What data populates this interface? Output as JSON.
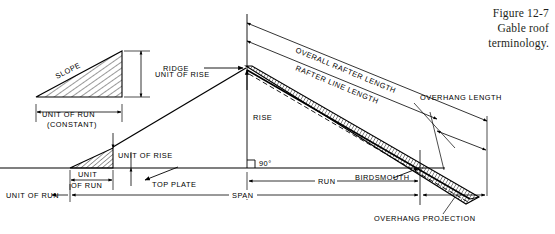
{
  "figure": {
    "caption_line1": "Figure 12-7",
    "caption_line2": "Gable roof",
    "caption_line3": "terminology."
  },
  "labels": {
    "slope": "SLOPE",
    "unit_of_rise_1": "UNIT OF RISE",
    "unit_of_run_constant_1": "UNIT OF RUN",
    "unit_of_run_constant_2": "(CONSTANT)",
    "unit_of_rise_2": "UNIT OF RISE",
    "unit_small_1": "UNIT",
    "unit_small_2": "OF RUN",
    "unit_of_run_left": "UNIT OF RUN",
    "top_plate": "TOP PLATE",
    "ridge": "RIDGE",
    "rise": "RISE",
    "angle_90": "90°",
    "overall_rafter_length": "OVERALL RAFTER LENGTH",
    "rafter_line_length": "RAFTER LINE LENGTH",
    "overhang_length": "OVERHANG LENGTH",
    "birdsmouth": "BIRDSMOUTH",
    "run": "RUN",
    "span": "SPAN",
    "overhang_projection": "OVERHANG PROJECTION"
  },
  "style": {
    "ink": "#000000",
    "caption_ink": "#231f20",
    "paper": "#ffffff",
    "label_font_size": "7.4",
    "caption_font_size": "11.5"
  },
  "geometry": {
    "ridge_point": [
      247,
      68
    ],
    "eave_point": [
      420,
      168
    ],
    "rafter_tail": [
      470,
      197
    ],
    "plate_line_y": 168,
    "span_left_x": 70,
    "run_left_x": 247
  },
  "diagram": {
    "type": "technical-line-drawing"
  }
}
